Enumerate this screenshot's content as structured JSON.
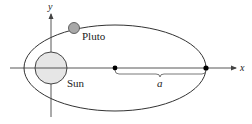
{
  "diagram": {
    "labels": {
      "x_axis": "x",
      "y_axis": "y",
      "sun": "Sun",
      "pluto": "Pluto",
      "semi_major_axis": "a"
    },
    "colors": {
      "line": "#333333",
      "sun_fill": "#e6e6e6",
      "pluto_fill": "#a8a8a8",
      "dot": "#000000",
      "label": "#222222"
    }
  }
}
